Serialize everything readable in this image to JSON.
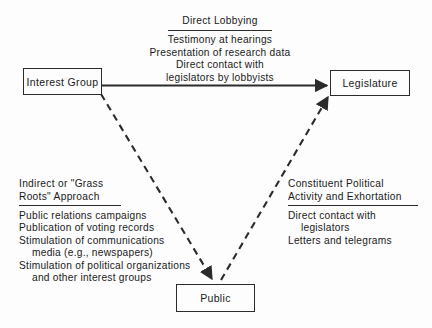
{
  "diagram": {
    "background_color": "#fdfdfd",
    "line_color": "#2b2b2b",
    "nodes": {
      "interest_group": {
        "label": "Interest Group"
      },
      "legislature": {
        "label": "Legislature"
      },
      "public": {
        "label": "Public"
      }
    },
    "blocks": {
      "direct_lobbying": {
        "heading_lines": [
          "Direct Lobbying"
        ],
        "body_lines": [
          {
            "text": "Testimony at hearings",
            "indented": false
          },
          {
            "text": "Presentation of research data",
            "indented": false
          },
          {
            "text": "Direct contact with",
            "indented": false
          },
          {
            "text": "legislators by lobbyists",
            "indented": false
          }
        ]
      },
      "grass_roots": {
        "heading_lines": [
          "Indirect or \"Grass",
          "Roots\" Approach"
        ],
        "body_lines": [
          {
            "text": "Public relations campaigns",
            "indented": false
          },
          {
            "text": "Publication of voting records",
            "indented": false
          },
          {
            "text": "Stimulation of communications",
            "indented": false
          },
          {
            "text": "media (e.g., newspapers)",
            "indented": true
          },
          {
            "text": "Stimulation of political organizations",
            "indented": false
          },
          {
            "text": "and other interest groups",
            "indented": true
          }
        ]
      },
      "constituent_activity": {
        "heading_lines": [
          "Constituent Political",
          "Activity and Exhortation"
        ],
        "body_lines": [
          {
            "text": "Direct contact with",
            "indented": false
          },
          {
            "text": "legislators",
            "indented": true
          },
          {
            "text": "Letters and telegrams",
            "indented": false
          }
        ]
      }
    },
    "connectors": [
      {
        "name": "interest-group-to-legislature",
        "style": "solid",
        "from": "interest_group",
        "to": "legislature",
        "label_block": "direct_lobbying"
      },
      {
        "name": "interest-group-to-public",
        "style": "dashed",
        "from": "interest_group",
        "to": "public",
        "label_block": "grass_roots"
      },
      {
        "name": "public-to-legislature",
        "style": "dashed",
        "from": "public",
        "to": "legislature",
        "label_block": "constituent_activity"
      }
    ]
  }
}
